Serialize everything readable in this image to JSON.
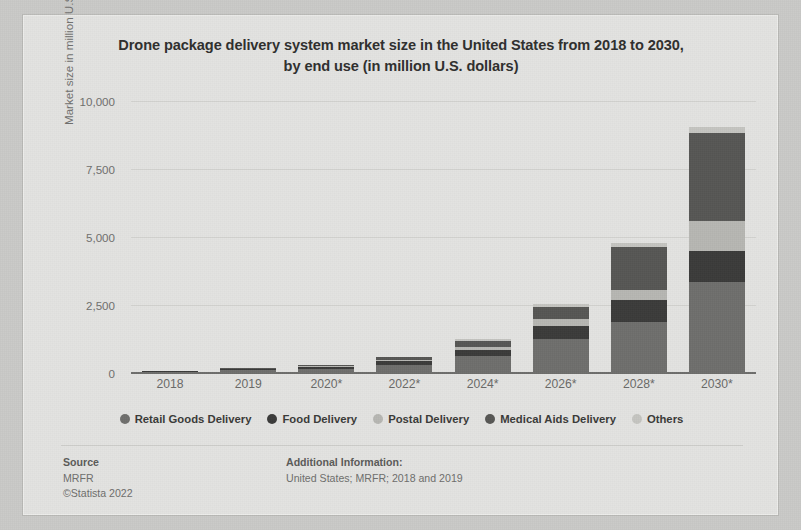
{
  "chart_data": {
    "type": "bar",
    "stacked": true,
    "title": "Drone package delivery system market size in the United States from 2018 to 2030, by end use (in million U.S. dollars)",
    "title_line1": "Drone package delivery system market size in the United States from 2018 to 2030,",
    "title_line2": "by end use (in million U.S. dollars)",
    "xlabel": "",
    "ylabel": "Market size in million U.S. dollars",
    "categories": [
      "2018",
      "2019",
      "2020*",
      "2022*",
      "2024*",
      "2026*",
      "2028*",
      "2030*"
    ],
    "ylim": [
      0,
      10000
    ],
    "yticks": [
      "0",
      "2,500",
      "5,000",
      "7,500",
      "10,000"
    ],
    "ytick_values": [
      0,
      2500,
      5000,
      7500,
      10000
    ],
    "grid": true,
    "legend_position": "bottom",
    "series": [
      {
        "name": "Retail Goods Delivery",
        "color": "#6e6e6c",
        "values": [
          40,
          95,
          150,
          310,
          620,
          1240,
          1880,
          3350
        ]
      },
      {
        "name": "Food Delivery",
        "color": "#3b3b3a",
        "values": [
          20,
          40,
          60,
          120,
          230,
          500,
          790,
          1130
        ]
      },
      {
        "name": "Postal Delivery",
        "color": "#b6b6b2",
        "values": [
          10,
          20,
          30,
          60,
          120,
          230,
          390,
          1120
        ]
      },
      {
        "name": "Medical Aids Delivery",
        "color": "#565654",
        "values": [
          15,
          30,
          45,
          90,
          210,
          450,
          1570,
          3230
        ]
      },
      {
        "name": "Others",
        "color": "#c4c4c0",
        "values": [
          5,
          10,
          15,
          25,
          60,
          100,
          150,
          200
        ]
      }
    ]
  },
  "footer": {
    "source_heading": "Source",
    "source_name": "MRFR",
    "source_copyright": "©Statista 2022",
    "additional_heading": "Additional Information:",
    "additional_text": "United States; MRFR; 2018 and 2019"
  },
  "theme": {
    "page_bg": "#c9c9c7",
    "card_bg": "#e3e3e1",
    "text_primary": "#2f2f2e",
    "text_muted": "#6f6f6d",
    "gridline": "#d2d2cf",
    "axis": "#6d6d6b"
  }
}
